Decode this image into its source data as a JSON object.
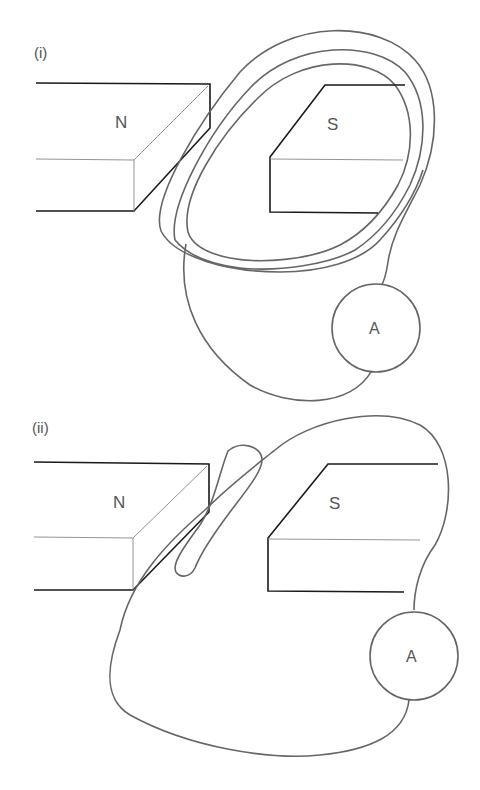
{
  "figure": {
    "parts": [
      {
        "label": "(i)",
        "magnet_left": "N",
        "magnet_right": "S",
        "meter": "A",
        "coil": "three-turn coil looping around the S magnet, connected to ammeter"
      },
      {
        "label": "(ii)",
        "magnet_left": "N",
        "magnet_right": "S",
        "meter": "A",
        "coil": "single loop with a narrow slot between the magnets, connected to ammeter"
      }
    ],
    "colors": {
      "magnet_outline": "#1a1a1a",
      "wire": "#666666",
      "text": "#555555",
      "background": "#ffffff"
    }
  }
}
